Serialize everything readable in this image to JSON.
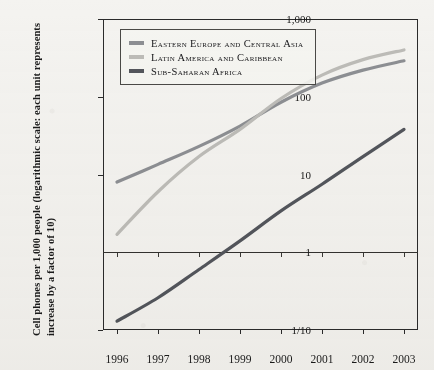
{
  "chart_data": {
    "type": "line",
    "title": "",
    "xlabel": "",
    "ylabel": "Cell phones per 1,000 people (logarithmic scale: each unit represents increase by a factor of 10)",
    "x": [
      1996,
      1997,
      1998,
      1999,
      2000,
      2001,
      2002,
      2003
    ],
    "xtick_labels": [
      "1996",
      "1997",
      "1998",
      "1999",
      "2000",
      "2001",
      "2002",
      "2003"
    ],
    "ytick_labels": [
      "1,000",
      "100",
      "10",
      "1",
      "1/10"
    ],
    "ytick_values": [
      1000,
      100,
      10,
      1,
      0.1
    ],
    "ylim": [
      0.1,
      1000
    ],
    "yscale": "log",
    "grid": false,
    "gridline_at": 1,
    "legend_position": "top-left",
    "series": [
      {
        "name": "Eastern Europe and Central Asia",
        "color": "#8d8f93",
        "values": [
          8.0,
          13.5,
          23.0,
          42.0,
          85.0,
          150.0,
          220.0,
          290.0
        ]
      },
      {
        "name": "Latin America and Caribbean",
        "color": "#bdbcb8",
        "values": [
          1.7,
          6.0,
          17.0,
          38.0,
          95.0,
          190.0,
          300.0,
          400.0
        ]
      },
      {
        "name": "Sub-Saharan Africa",
        "color": "#53565c",
        "values": [
          0.13,
          0.26,
          0.6,
          1.4,
          3.4,
          7.5,
          17.0,
          38.0
        ]
      }
    ]
  },
  "legend": {
    "items": [
      {
        "label": "Eastern Europe and Central Asia",
        "color": "#8d8f93"
      },
      {
        "label": "Latin America and Caribbean",
        "color": "#bdbcb8"
      },
      {
        "label": "Sub-Saharan Africa",
        "color": "#53565c"
      }
    ]
  },
  "axes": {
    "y_title": "Cell phones per 1,000 people (logarithmic scale: each unit represents increase by a factor of 10)"
  }
}
